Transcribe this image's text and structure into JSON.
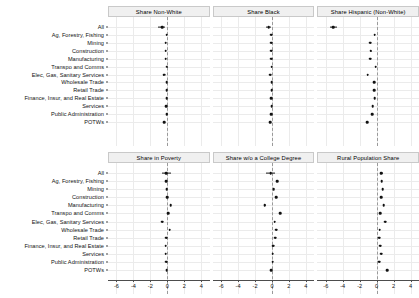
{
  "chart_data": {
    "type": "scatter",
    "plot_style": "faceted-coefficient-plot",
    "title": "",
    "xlabel": "",
    "ylabel": "",
    "xlim": [
      -7,
      5
    ],
    "xticks": [
      -6,
      -4,
      -2,
      0,
      2,
      4
    ],
    "xticklabels": [
      "-6",
      "-4",
      "-2",
      "0",
      "2",
      "4"
    ],
    "grid": true,
    "reference_line": 0,
    "reference_line_style": "dashed",
    "legend": "none",
    "categories": [
      "All",
      "Ag, Forestry, Fishing",
      "Mining",
      "Construction",
      "Manufacturing",
      "Transpo and Comms",
      "Elec, Gas, Sanitary Services",
      "Wholesale Trade",
      "Retail Trade",
      "Finance, Insur, and Real Estate",
      "Services",
      "Public Administration",
      "POTWs"
    ],
    "panels": [
      {
        "title": "Share Non-White",
        "row": 0,
        "col": 0,
        "values": [
          -0.62,
          -0.08,
          -0.18,
          -0.18,
          -0.18,
          -0.05,
          -0.4,
          -0.08,
          -0.08,
          -0.08,
          -0.1,
          -0.05,
          -0.38
        ],
        "err_low": [
          -1.05,
          -0.12,
          -0.22,
          -0.22,
          -0.22,
          -0.09,
          -0.45,
          -0.12,
          -0.12,
          -0.12,
          -0.14,
          -0.09,
          -0.43
        ],
        "err_high": [
          -0.3,
          -0.04,
          -0.14,
          -0.14,
          -0.14,
          -0.01,
          -0.35,
          -0.04,
          -0.04,
          -0.04,
          -0.06,
          -0.01,
          -0.33
        ]
      },
      {
        "title": "Share Black",
        "row": 0,
        "col": 1,
        "values": [
          -0.38,
          -0.1,
          -0.1,
          -0.12,
          -0.12,
          -0.02,
          -0.22,
          -0.05,
          -0.05,
          -0.08,
          -0.05,
          -0.08,
          -0.22
        ],
        "err_low": [
          -0.72,
          -0.14,
          -0.14,
          -0.16,
          -0.16,
          -0.06,
          -0.27,
          -0.09,
          -0.09,
          -0.12,
          -0.09,
          -0.12,
          -0.27
        ],
        "err_high": [
          -0.1,
          -0.06,
          -0.06,
          -0.08,
          -0.08,
          0.02,
          -0.17,
          -0.01,
          -0.01,
          -0.04,
          -0.01,
          -0.04,
          -0.17
        ]
      },
      {
        "title": "Share Hispanic (Non-White)",
        "row": 0,
        "col": 2,
        "values": [
          -5.15,
          -0.22,
          -0.75,
          -0.68,
          -0.75,
          -0.12,
          -1.05,
          -0.28,
          -0.32,
          -0.22,
          -0.45,
          -0.55,
          -1.15
        ],
        "err_low": [
          -5.55,
          -0.28,
          -0.82,
          -0.76,
          -0.82,
          -0.18,
          -1.12,
          -0.34,
          -0.38,
          -0.28,
          -0.52,
          -0.62,
          -1.22
        ],
        "err_high": [
          -4.7,
          -0.16,
          -0.68,
          -0.6,
          -0.68,
          -0.06,
          -0.98,
          -0.22,
          -0.26,
          -0.16,
          -0.38,
          -0.48,
          -1.08
        ]
      },
      {
        "title": "Share in Poverty",
        "row": 1,
        "col": 0,
        "values": [
          -0.1,
          -0.15,
          -0.05,
          0.0,
          0.42,
          0.08,
          -0.58,
          0.3,
          -0.12,
          -0.18,
          -0.2,
          -0.1,
          -0.05
        ],
        "err_low": [
          -0.6,
          -0.2,
          -0.1,
          -0.05,
          0.36,
          0.02,
          -0.64,
          0.24,
          -0.17,
          -0.23,
          -0.25,
          -0.15,
          -0.1
        ],
        "err_high": [
          0.42,
          -0.1,
          0.0,
          0.05,
          0.48,
          0.14,
          -0.52,
          0.36,
          -0.07,
          -0.13,
          -0.15,
          -0.05,
          0.0
        ]
      },
      {
        "title": "Share w/o a College Degree",
        "row": 1,
        "col": 1,
        "values": [
          -0.15,
          0.62,
          0.22,
          0.52,
          -0.85,
          0.95,
          0.3,
          0.48,
          0.4,
          0.12,
          0.08,
          0.1,
          -0.1,
          1.1
        ],
        "err_low": [
          -0.68,
          0.54,
          0.16,
          0.44,
          -0.94,
          0.88,
          0.24,
          0.42,
          0.34,
          0.06,
          0.02,
          0.04,
          -0.16
        ],
        "err_high": [
          0.38,
          0.7,
          0.28,
          0.6,
          -0.76,
          1.02,
          0.36,
          0.54,
          0.46,
          0.18,
          0.14,
          0.16,
          -0.04
        ]
      },
      {
        "title": "Rural Population Share",
        "row": 1,
        "col": 2,
        "values": [
          0.55,
          0.62,
          0.7,
          0.55,
          0.85,
          0.42,
          1.0,
          0.35,
          0.28,
          0.4,
          0.55,
          0.32,
          1.25
        ],
        "err_low": [
          0.4,
          0.56,
          0.64,
          0.49,
          0.78,
          0.36,
          0.93,
          0.29,
          0.22,
          0.34,
          0.49,
          0.26,
          1.18
        ],
        "err_high": [
          0.72,
          0.68,
          0.76,
          0.61,
          0.92,
          0.48,
          1.07,
          0.41,
          0.34,
          0.46,
          0.61,
          0.38,
          1.32
        ]
      }
    ]
  },
  "colors": {
    "point": "#111111",
    "gridline": "#ebebeb",
    "strip_background": "#f0f0f0",
    "strip_border": "#c9c9c9",
    "axis": "#4d4d4d",
    "reference_line": "#9a9a9a",
    "panel_background": "#ffffff"
  }
}
